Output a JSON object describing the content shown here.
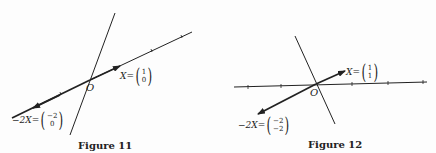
{
  "figures": [
    {
      "caption": "Figure 11",
      "origin_label": "O",
      "vector_label": {
        "name": "X",
        "eq": "=",
        "top": "1",
        "bottom": "0"
      },
      "scaled_label": {
        "name": "−2X",
        "eq": "=",
        "top": "−2",
        "bottom": "0"
      }
    },
    {
      "caption": "Figure 12",
      "origin_label": "O",
      "vector_label": {
        "name": "X",
        "eq": "=",
        "top": "1",
        "bottom": "1"
      },
      "scaled_label": {
        "name": "−2X",
        "eq": "=",
        "top": "−2",
        "bottom": "−2"
      }
    }
  ],
  "colors": {
    "ink": "#222222",
    "background": "#fdfdfd"
  }
}
